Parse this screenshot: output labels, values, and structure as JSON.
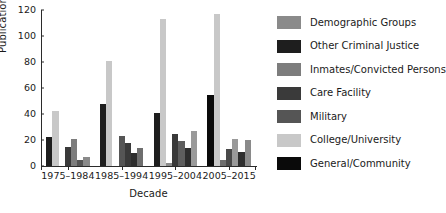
{
  "chart_data": {
    "type": "bar",
    "title": "",
    "xlabel": "Decade",
    "ylabel": "Publications",
    "ylim": [
      0,
      120
    ],
    "yticks": [
      0,
      20,
      40,
      60,
      80,
      100,
      120
    ],
    "grid": false,
    "legend_position": "right",
    "categories": [
      "1975–1984",
      "1985–1994",
      "1995–2004",
      "2005–2015"
    ],
    "series": [
      {
        "name": "Demographic Groups",
        "color": "#8a8a8a",
        "values": [
          22,
          48,
          41,
          55
        ]
      },
      {
        "name": "Other Criminal Justice",
        "color": "#1e1e1e",
        "values": [
          42,
          81,
          113,
          117
        ]
      },
      {
        "name": "Inmates/Convicted Persons",
        "color": "#7d7d7d",
        "values": [
          0,
          0,
          2,
          5
        ]
      },
      {
        "name": "Care Facility",
        "color": "#3a3a3a",
        "values": [
          15,
          23,
          25,
          13
        ]
      },
      {
        "name": "Military",
        "color": "#555555",
        "values": [
          21,
          18,
          19,
          21
        ]
      },
      {
        "name": "College/University",
        "color": "#c8c8c8",
        "values": [
          5,
          10,
          14,
          11
        ]
      },
      {
        "name": "General/Community",
        "color": "#0a0a0a",
        "values": [
          7,
          14,
          27,
          20
        ]
      }
    ],
    "bars": [
      {
        "group": "1975–1984",
        "bars": [
          {
            "series": "Demographic Groups",
            "value": 22,
            "color": "#1e1e1e"
          },
          {
            "series": "Other Criminal Justice",
            "value": 42,
            "color": "#c8c8c8"
          },
          {
            "series": "Inmates/Convicted Persons",
            "value": 0,
            "color": "#8a8a8a"
          },
          {
            "series": "Care Facility",
            "value": 15,
            "color": "#3a3a3a"
          },
          {
            "series": "Military",
            "value": 21,
            "color": "#7d7d7d"
          },
          {
            "series": "College/University",
            "value": 5,
            "color": "#555555"
          },
          {
            "series": "General/Community",
            "value": 7,
            "color": "#8a8a8a"
          }
        ]
      },
      {
        "group": "1985–1994",
        "bars": [
          {
            "series": "Demographic Groups",
            "value": 48,
            "color": "#1e1e1e"
          },
          {
            "series": "Other Criminal Justice",
            "value": 81,
            "color": "#c8c8c8"
          },
          {
            "series": "Inmates/Convicted Persons",
            "value": 0,
            "color": "#8a8a8a"
          },
          {
            "series": "Care Facility",
            "value": 23,
            "color": "#555555"
          },
          {
            "series": "Military",
            "value": 18,
            "color": "#3a3a3a"
          },
          {
            "series": "College/University",
            "value": 10,
            "color": "#2e2e2e"
          },
          {
            "series": "General/Community",
            "value": 14,
            "color": "#6e6e6e"
          }
        ]
      },
      {
        "group": "1995–2004",
        "bars": [
          {
            "series": "Demographic Groups",
            "value": 41,
            "color": "#1e1e1e"
          },
          {
            "series": "Other Criminal Justice",
            "value": 113,
            "color": "#c8c8c8"
          },
          {
            "series": "Inmates/Convicted Persons",
            "value": 2,
            "color": "#8a8a8a"
          },
          {
            "series": "Care Facility",
            "value": 25,
            "color": "#3a3a3a"
          },
          {
            "series": "Military",
            "value": 19,
            "color": "#5e5e5e"
          },
          {
            "series": "College/University",
            "value": 14,
            "color": "#2e2e2e"
          },
          {
            "series": "General/Community",
            "value": 27,
            "color": "#9a9a9a"
          }
        ]
      },
      {
        "group": "2005–2015",
        "bars": [
          {
            "series": "Demographic Groups",
            "value": 55,
            "color": "#0a0a0a"
          },
          {
            "series": "Other Criminal Justice",
            "value": 117,
            "color": "#c8c8c8"
          },
          {
            "series": "Inmates/Convicted Persons",
            "value": 5,
            "color": "#6e6e6e"
          },
          {
            "series": "Care Facility",
            "value": 13,
            "color": "#4a4a4a"
          },
          {
            "series": "Military",
            "value": 21,
            "color": "#9a9a9a"
          },
          {
            "series": "College/University",
            "value": 11,
            "color": "#2e2e2e"
          },
          {
            "series": "General/Community",
            "value": 20,
            "color": "#8a8a8a"
          }
        ]
      }
    ]
  },
  "legend": {
    "items": [
      {
        "label": "Demographic Groups",
        "color": "#8a8a8a"
      },
      {
        "label": "Other Criminal Justice",
        "color": "#1e1e1e"
      },
      {
        "label": "Inmates/Convicted Persons",
        "color": "#7d7d7d"
      },
      {
        "label": "Care Facility",
        "color": "#3a3a3a"
      },
      {
        "label": "Military",
        "color": "#555555"
      },
      {
        "label": "College/University",
        "color": "#c8c8c8"
      },
      {
        "label": "General/Community",
        "color": "#0a0a0a"
      }
    ]
  }
}
